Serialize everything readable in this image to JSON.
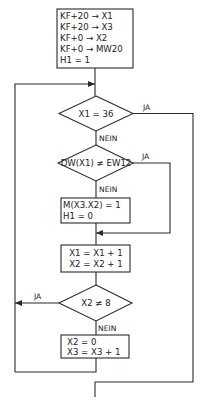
{
  "flowchart": {
    "init_box": {
      "lines": [
        "KF+20 → X1",
        "KF+20 → X3",
        "KF+0  → X2",
        "KF+0  → MW20",
        "H1 = 1"
      ]
    },
    "decision1": {
      "text": "X1 = 36",
      "yes_label": "JA",
      "no_label": "NEIN"
    },
    "decision2": {
      "text": "DW(X1) ≠ EW12",
      "yes_label": "JA",
      "no_label": "NEIN"
    },
    "action_box1": {
      "lines": [
        "M(X3.X2) = 1",
        "H1 = 0"
      ]
    },
    "action_box2": {
      "lines": [
        "X1 = X1 + 1",
        "X2 = X2 + 1"
      ]
    },
    "decision3": {
      "text": "X2 ≠ 8",
      "yes_label": "JA",
      "no_label": "NEIN"
    },
    "action_box3": {
      "lines": [
        "X2 = 0",
        "X3 = X3 + 1"
      ]
    }
  }
}
